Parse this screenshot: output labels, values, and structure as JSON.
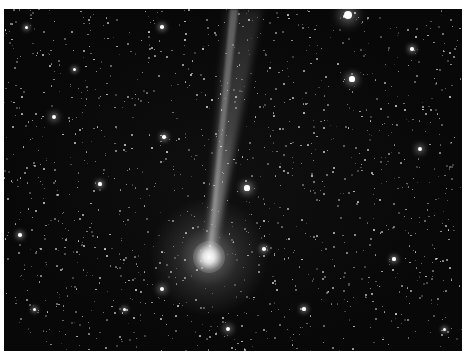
{
  "caption": "",
  "image": {
    "subject": "comet with ion tail in dense star field",
    "colors": {
      "sky": "#080808",
      "coma": "#f2f2f2",
      "tail": "#bfbfbf",
      "star": "#ffffff"
    },
    "comet": {
      "head_x": 205,
      "head_y": 248,
      "tail_end_x": 240,
      "tail_end_y": 0
    },
    "bright_stars": [
      {
        "x": 344,
        "y": 6,
        "r": 4
      },
      {
        "x": 348,
        "y": 70,
        "r": 2.6
      },
      {
        "x": 243,
        "y": 179,
        "r": 2.6
      },
      {
        "x": 158,
        "y": 280,
        "r": 2.2
      },
      {
        "x": 50,
        "y": 108,
        "r": 2
      },
      {
        "x": 158,
        "y": 18,
        "r": 1.8
      },
      {
        "x": 408,
        "y": 40,
        "r": 1.8
      },
      {
        "x": 16,
        "y": 226,
        "r": 1.8
      },
      {
        "x": 224,
        "y": 320,
        "r": 2.2
      },
      {
        "x": 96,
        "y": 175,
        "r": 1.6
      },
      {
        "x": 416,
        "y": 140,
        "r": 2
      },
      {
        "x": 160,
        "y": 128,
        "r": 1.8
      },
      {
        "x": 300,
        "y": 300,
        "r": 1.6
      },
      {
        "x": 390,
        "y": 250,
        "r": 1.6
      },
      {
        "x": 70,
        "y": 60,
        "r": 1.5
      },
      {
        "x": 260,
        "y": 240,
        "r": 1.8
      },
      {
        "x": 120,
        "y": 300,
        "r": 1.5
      },
      {
        "x": 22,
        "y": 18,
        "r": 1.5
      },
      {
        "x": 440,
        "y": 320,
        "r": 1.5
      },
      {
        "x": 30,
        "y": 300,
        "r": 1.5
      }
    ]
  }
}
